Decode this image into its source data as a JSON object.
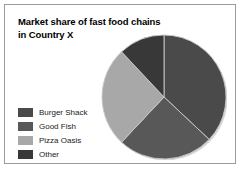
{
  "figure": {
    "title_line1": "Market share of fast food chains",
    "title_line2": "in Country X",
    "border_color": "#9a9a9a",
    "background": "#ffffff"
  },
  "legend": {
    "items": [
      {
        "label": "Burger Shack",
        "color": "#4a4a4a"
      },
      {
        "label": "Good Fish",
        "color": "#585858"
      },
      {
        "label": "Pizza Oasis",
        "color": "#a8a8a8"
      },
      {
        "label": "Other",
        "color": "#383838"
      }
    ]
  },
  "chart_data": {
    "type": "pie",
    "title": "Market share of fast food chains in Country X",
    "categories": [
      "Burger Shack",
      "Good Fish",
      "Pizza Oasis",
      "Other"
    ],
    "values": [
      37,
      25,
      26,
      12
    ],
    "unit": "percent",
    "colors": [
      "#4a4a4a",
      "#585858",
      "#a8a8a8",
      "#383838"
    ],
    "start_angle_deg": 0,
    "direction": "clockwise",
    "legend_position": "left",
    "labels_shown": false,
    "grid": false,
    "center": {
      "x": 63,
      "y": 63
    },
    "radius": 62
  }
}
